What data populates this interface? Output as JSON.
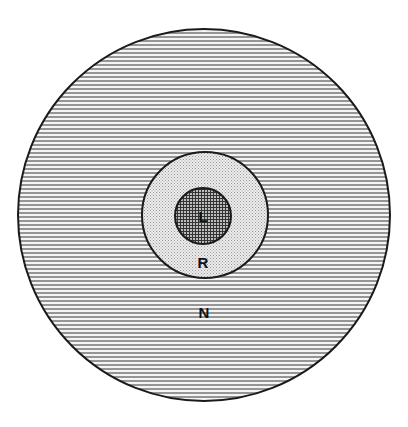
{
  "diagram": {
    "type": "concentric-circles",
    "regions": [
      {
        "id": "outer",
        "label": "N",
        "pattern": "horizontal-lines",
        "cx": 204,
        "cy": 215,
        "r": 186
      },
      {
        "id": "middle",
        "label": "R",
        "pattern": "stipple",
        "cx": 205,
        "cy": 215,
        "r": 63
      },
      {
        "id": "inner",
        "label": "L",
        "pattern": "crosshatch",
        "cx": 203,
        "cy": 216,
        "r": 28
      }
    ],
    "colors": {
      "stroke": "#1a1a1a",
      "hatch": "#555555",
      "stipple_bg": "#e6e6e6",
      "crosshatch_bg": "#8a8a8a",
      "background": "#ffffff"
    }
  },
  "labels": {
    "outer": "N",
    "middle": "R",
    "inner": "L"
  }
}
